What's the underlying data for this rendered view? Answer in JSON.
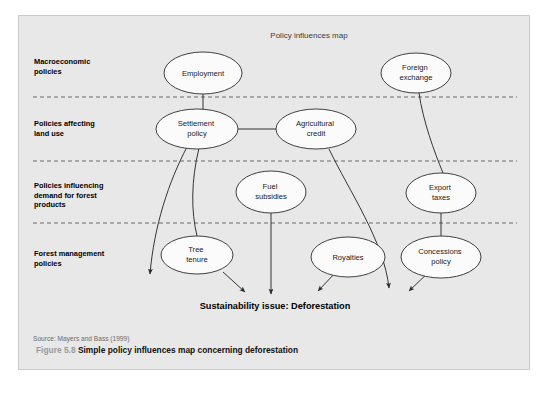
{
  "figure": {
    "title": "Policy influences map",
    "caption_number": "Figure 5.8",
    "caption_text": "Simple policy influences map concerning deforestation",
    "source": "Source: Mayers and Bass (1999)",
    "outcome": "Sustainability issue: Deforestation",
    "background_color": "#e8e8e8",
    "border_color": "#c9c9c9",
    "node_fill": "#fbfbfb",
    "node_stroke": "#2b2b2b"
  },
  "bands": [
    {
      "id": "macroeconomic",
      "line1": "Macroeconomic",
      "line2": "policies",
      "line3": ""
    },
    {
      "id": "land-use",
      "line1": "Policies affecting",
      "line2": "land use",
      "line3": ""
    },
    {
      "id": "forest-demand",
      "line1": "Policies influencing",
      "line2": "demand for forest",
      "line3": "products"
    },
    {
      "id": "forest-management",
      "line1": "Forest management",
      "line2": "policies",
      "line3": ""
    }
  ],
  "nodes": [
    {
      "id": "employment",
      "line1": "Employment",
      "line2": "",
      "cx": 202,
      "cy": 72,
      "rx": 39,
      "ry": 21
    },
    {
      "id": "foreign-exchange",
      "line1": "Foreign",
      "line2": "exchange",
      "cx": 415,
      "cy": 72,
      "rx": 35,
      "ry": 20
    },
    {
      "id": "settlement-policy",
      "line1": "Settlement",
      "line2": "policy",
      "cx": 196,
      "cy": 128,
      "rx": 41,
      "ry": 20
    },
    {
      "id": "agricultural-credit",
      "line1": "Agricultural",
      "line2": "credit",
      "cx": 315,
      "cy": 128,
      "rx": 40,
      "ry": 20
    },
    {
      "id": "fuel-subsidies",
      "line1": "Fuel",
      "line2": "subsidies",
      "cx": 270,
      "cy": 191,
      "rx": 35,
      "ry": 21
    },
    {
      "id": "export-taxes",
      "line1": "Export",
      "line2": "taxes",
      "cx": 440,
      "cy": 192,
      "rx": 35,
      "ry": 20
    },
    {
      "id": "tree-tenure",
      "line1": "Tree",
      "line2": "tenure",
      "cx": 196,
      "cy": 254,
      "rx": 36,
      "ry": 19
    },
    {
      "id": "royalties",
      "line1": "Royalties",
      "line2": "",
      "cx": 347,
      "cy": 256,
      "rx": 37,
      "ry": 20
    },
    {
      "id": "concessions-policy",
      "line1": "Concessions",
      "line2": "policy",
      "cx": 440,
      "cy": 256,
      "rx": 40,
      "ry": 21
    }
  ],
  "dividers": [
    {
      "id": "divider-1",
      "y": 96
    },
    {
      "id": "divider-2",
      "y": 160
    },
    {
      "id": "divider-3",
      "y": 222
    }
  ],
  "edges": [
    {
      "id": "employment-to-settlement",
      "from": "employment",
      "to": "settlement-policy",
      "arrow": false
    },
    {
      "id": "settlement-to-agricultural",
      "from": "settlement-policy",
      "to": "agricultural-credit",
      "arrow": false
    },
    {
      "id": "foreign-exchange-to-export-taxes",
      "from": "foreign-exchange",
      "to": "export-taxes",
      "arrow": false
    },
    {
      "id": "export-taxes-to-concessions",
      "from": "export-taxes",
      "to": "concessions-policy",
      "arrow": false
    },
    {
      "id": "fuel-subsidies-to-deforestation",
      "from": "fuel-subsidies",
      "to": "outcome",
      "arrow": true
    },
    {
      "id": "settlement-to-deforestation",
      "from": "settlement-policy",
      "to": "outcome",
      "arrow": true
    },
    {
      "id": "settlement-to-tree-tenure",
      "from": "settlement-policy",
      "to": "tree-tenure",
      "arrow": false
    },
    {
      "id": "tree-tenure-to-deforestation",
      "from": "tree-tenure",
      "to": "outcome",
      "arrow": true
    },
    {
      "id": "agricultural-credit-to-deforestation",
      "from": "agricultural-credit",
      "to": "outcome",
      "arrow": true
    },
    {
      "id": "royalties-to-deforestation",
      "from": "royalties",
      "to": "outcome",
      "arrow": true
    },
    {
      "id": "concessions-to-deforestation",
      "from": "concessions-policy",
      "to": "outcome",
      "arrow": true
    }
  ]
}
